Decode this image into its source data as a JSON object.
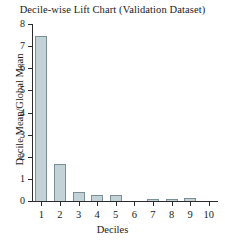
{
  "chart_data": {
    "type": "bar",
    "title": "Decile-wise Lift Chart (Validation Dataset)",
    "xlabel": "Deciles",
    "ylabel": "Decile Mean/Global Mean",
    "categories": [
      "1",
      "2",
      "3",
      "4",
      "5",
      "6",
      "7",
      "8",
      "9",
      "10"
    ],
    "values": [
      7.45,
      1.65,
      0.42,
      0.28,
      0.27,
      0.0,
      0.1,
      0.1,
      0.12,
      0.0
    ],
    "ylim": [
      0,
      8
    ],
    "ytick_labels": [
      "0",
      "1",
      "2",
      "3",
      "4",
      "5",
      "6",
      "7",
      "8"
    ],
    "yticks": [
      0,
      1,
      2,
      3,
      4,
      5,
      6,
      7,
      8
    ],
    "grid": false,
    "legend": false,
    "bar_fill_color": "#c3d2d6",
    "bar_edge_color": "#7a8f96",
    "axis_color": "#2b2b2b",
    "background_color": "#ffffff"
  }
}
